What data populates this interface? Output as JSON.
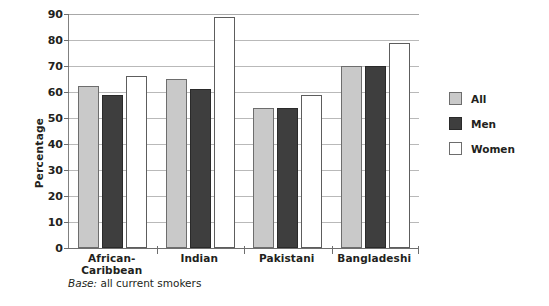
{
  "chart_data": {
    "type": "bar",
    "title": "",
    "xlabel": "",
    "ylabel": "Percentage",
    "ylim": [
      0,
      90
    ],
    "ytick_step": 10,
    "yticks": [
      90,
      80,
      70,
      60,
      50,
      40,
      30,
      20,
      10,
      0
    ],
    "grid": true,
    "legend_position": "right",
    "categories": [
      "African-Caribbean",
      "Indian",
      "Pakistani",
      "Bangladeshi"
    ],
    "category_lines": [
      [
        "African-",
        "Caribbean"
      ],
      [
        "Indian"
      ],
      [
        "Pakistani"
      ],
      [
        "Bangladeshi"
      ]
    ],
    "series": [
      {
        "name": "All",
        "color": "#c9c9c9",
        "values": [
          62.5,
          65,
          54,
          70
        ]
      },
      {
        "name": "Men",
        "color": "#3e3e3e",
        "values": [
          59,
          61,
          54,
          70
        ]
      },
      {
        "name": "Women",
        "color": "#ffffff",
        "values": [
          66,
          89,
          59,
          79
        ]
      }
    ],
    "footnote_label": "Base:",
    "footnote_text": " all current smokers"
  },
  "axis": {
    "y_title": "Percentage"
  },
  "legend": {
    "items": [
      {
        "label": "All"
      },
      {
        "label": "Men"
      },
      {
        "label": "Women"
      }
    ]
  },
  "colors": {
    "all": "#c9c9c9",
    "men": "#3e3e3e",
    "women": "#ffffff",
    "grid": "#b9b9b9",
    "axis": "#6e6e6e",
    "text": "#231f20"
  }
}
